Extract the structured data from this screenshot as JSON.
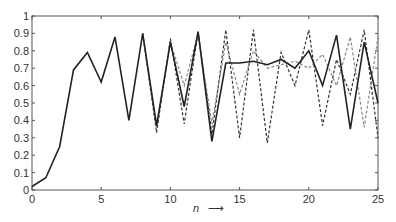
{
  "chart_data": {
    "type": "line",
    "title": "",
    "xlabel": "n",
    "xlabel_arrow": "→",
    "ylabel": "",
    "xlim": [
      0,
      25
    ],
    "ylim": [
      0,
      1
    ],
    "xticks": [
      0,
      5,
      10,
      15,
      20,
      25
    ],
    "yticks": [
      0,
      0.1,
      0.2,
      0.3,
      0.4,
      0.5,
      0.6,
      0.7,
      0.8,
      0.9,
      1
    ],
    "ytick_labels": [
      "0",
      "0.1",
      "0.2",
      "0.3",
      "0.4",
      "0.5",
      "0.6",
      "0.7",
      "0.8",
      "0.9",
      "1"
    ],
    "grid": false,
    "legend": null,
    "series": [
      {
        "name": "solid",
        "style": "solid",
        "color": "#222222",
        "x": [
          0,
          1,
          2,
          3,
          4,
          5,
          6,
          7,
          8,
          9,
          10,
          11,
          12,
          13,
          14,
          15,
          16,
          17,
          18,
          19,
          20,
          21,
          22,
          23,
          24,
          25
        ],
        "values": [
          0.02,
          0.07,
          0.25,
          0.69,
          0.79,
          0.62,
          0.88,
          0.4,
          0.9,
          0.37,
          0.85,
          0.48,
          0.91,
          0.28,
          0.73,
          0.73,
          0.74,
          0.72,
          0.75,
          0.7,
          0.8,
          0.6,
          0.89,
          0.35,
          0.85,
          0.5
        ]
      },
      {
        "name": "dashed-dark",
        "style": "dashed",
        "color": "#333333",
        "x": [
          8,
          9,
          10,
          11,
          12,
          13,
          14,
          15,
          16,
          17,
          18,
          19,
          20,
          21,
          22,
          23,
          24,
          25
        ],
        "values": [
          0.9,
          0.33,
          0.87,
          0.38,
          0.91,
          0.32,
          0.92,
          0.3,
          0.92,
          0.27,
          0.79,
          0.6,
          0.92,
          0.37,
          0.75,
          0.55,
          0.92,
          0.3
        ]
      },
      {
        "name": "dashed-light",
        "style": "dashed",
        "color": "#888888",
        "x": [
          8,
          9,
          10,
          11,
          12,
          13,
          14,
          15,
          16,
          17,
          18,
          19,
          20,
          21,
          22,
          23,
          24,
          25
        ],
        "values": [
          0.89,
          0.36,
          0.85,
          0.6,
          0.9,
          0.38,
          0.85,
          0.55,
          0.8,
          0.7,
          0.72,
          0.74,
          0.7,
          0.78,
          0.6,
          0.88,
          0.36,
          0.88
        ]
      }
    ]
  },
  "axes": {
    "x_label": "n",
    "x_arrow": "⟶"
  }
}
